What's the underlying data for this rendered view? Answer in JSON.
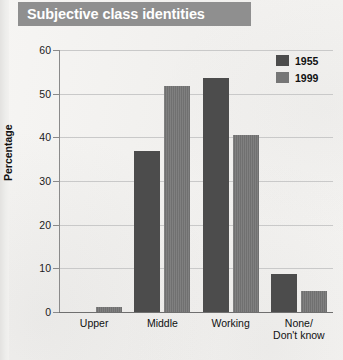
{
  "header": {
    "title": "Subjective class identities"
  },
  "chart_data": {
    "type": "bar",
    "title": "Subjective class identities",
    "xlabel": "",
    "ylabel": "Percentage",
    "ylim": [
      0,
      60
    ],
    "yticks": [
      0,
      10,
      20,
      30,
      40,
      50,
      60
    ],
    "grid": true,
    "legend_position": "top-right",
    "categories": [
      "Upper",
      "Middle",
      "Working",
      "None/\nDon't know"
    ],
    "series": [
      {
        "name": "1955",
        "color": "#4c4c4c",
        "values": [
          0,
          36.8,
          53.6,
          8.8
        ]
      },
      {
        "name": "1999",
        "color": "#767676",
        "values": [
          1.2,
          51.8,
          40.6,
          4.8
        ]
      }
    ]
  }
}
